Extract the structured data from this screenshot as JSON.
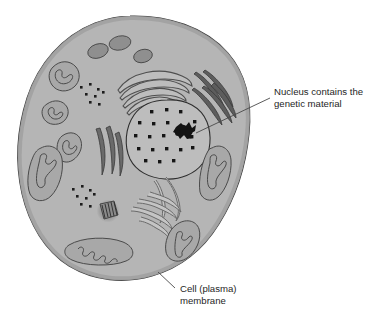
{
  "diagram": {
    "background_color": "#ffffff",
    "cytoplasm_color": "#b5b5b5",
    "cytoplasm_rim_color": "#a2a2a2",
    "outline_color": "#3c3c3c",
    "organelle_dark_color": "#6e6e6e",
    "organelle_light_color": "#c2c2c2",
    "chromatin_color": "#1a1a1a",
    "leader_line_color": "#4a4a4a",
    "text_color": "#262626"
  },
  "labels": {
    "nucleus": {
      "line1": "Nucleus contains the",
      "line2": "genetic material"
    },
    "membrane": {
      "line1": "Cell (plasma)",
      "line2": "membrane"
    }
  },
  "structures": {
    "cell_membrane": "cell-plasma-membrane",
    "nucleus": "nucleus",
    "nucleolus": "nucleolus",
    "chromatin_dots": "chromatin-granules",
    "golgi": "golgi-apparatus",
    "rough_er": "rough-endoplasmic-reticulum",
    "smooth_er": "smooth-endoplasmic-reticulum",
    "centriole": "centriole",
    "mitochondria": "mitochondria",
    "vesicles": "vesicles",
    "ribosomes": "ribosome-clusters"
  },
  "chromatin_positions": [
    [
      152,
      112
    ],
    [
      167,
      110
    ],
    [
      181,
      112
    ],
    [
      140,
      123
    ],
    [
      154,
      124
    ],
    [
      168,
      123
    ],
    [
      182,
      124
    ],
    [
      194,
      122
    ],
    [
      136,
      136
    ],
    [
      150,
      137
    ],
    [
      164,
      136
    ],
    [
      192,
      137
    ],
    [
      139,
      149
    ],
    [
      153,
      150
    ],
    [
      167,
      149
    ],
    [
      181,
      150
    ],
    [
      193,
      148
    ],
    [
      146,
      161
    ],
    [
      160,
      162
    ],
    [
      174,
      161
    ]
  ],
  "vesicle_positions": [
    [
      98,
      51
    ],
    [
      117,
      44
    ],
    [
      140,
      56
    ]
  ],
  "ribosome_cluster_top": [
    [
      82,
      88
    ],
    [
      90,
      85
    ],
    [
      97,
      90
    ],
    [
      87,
      95
    ],
    [
      95,
      97
    ],
    [
      103,
      93
    ],
    [
      91,
      102
    ],
    [
      99,
      104
    ]
  ],
  "ribosome_cluster_left": [
    [
      75,
      190
    ],
    [
      83,
      186
    ],
    [
      90,
      191
    ],
    [
      79,
      197
    ],
    [
      87,
      199
    ],
    [
      95,
      195
    ],
    [
      83,
      205
    ],
    [
      91,
      206
    ]
  ]
}
